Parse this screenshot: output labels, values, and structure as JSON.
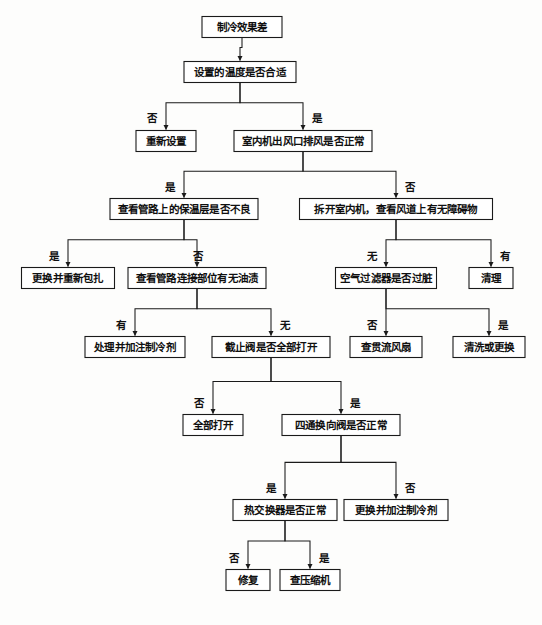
{
  "diagram": {
    "type": "flowchart",
    "orientation": "top-down",
    "colors": {
      "background": "#fdfdfc",
      "node_fill": "#ffffff",
      "node_stroke": "#1a1a1a",
      "text": "#101010",
      "link": "#1a1a1a"
    },
    "nodes": [
      {
        "id": "n1",
        "label": "制冷效果差",
        "x": 242,
        "y": 27,
        "w": 80,
        "h": 21,
        "kind": "start"
      },
      {
        "id": "n2",
        "label": "设置的温度是否合适",
        "x": 240,
        "y": 72,
        "w": 112,
        "h": 21,
        "kind": "decision"
      },
      {
        "id": "n3",
        "label": "重新设置",
        "x": 166,
        "y": 141,
        "w": 60,
        "h": 21,
        "kind": "action"
      },
      {
        "id": "n4",
        "label": "室内机出风口排风是否正常",
        "x": 303,
        "y": 141,
        "w": 138,
        "h": 21,
        "kind": "decision"
      },
      {
        "id": "n5",
        "label": "查看管路上的保温层是否不良",
        "x": 184,
        "y": 209,
        "w": 148,
        "h": 21,
        "kind": "decision"
      },
      {
        "id": "n6",
        "label": "拆开室内机，查看风道上有无障碍物",
        "x": 396,
        "y": 209,
        "w": 193,
        "h": 21,
        "kind": "decision"
      },
      {
        "id": "n7",
        "label": "更换并重新包扎",
        "x": 68,
        "y": 278,
        "w": 93,
        "h": 21,
        "kind": "action"
      },
      {
        "id": "n8",
        "label": "查看管路连接部位有无油渍",
        "x": 197,
        "y": 278,
        "w": 138,
        "h": 21,
        "kind": "decision"
      },
      {
        "id": "n9",
        "label": "空气过滤器是否过脏",
        "x": 386,
        "y": 278,
        "w": 101,
        "h": 21,
        "kind": "decision"
      },
      {
        "id": "n10",
        "label": "清理",
        "x": 491,
        "y": 278,
        "w": 44,
        "h": 21,
        "kind": "action"
      },
      {
        "id": "n11",
        "label": "处理并加注制冷剂",
        "x": 135,
        "y": 347,
        "w": 100,
        "h": 21,
        "kind": "action"
      },
      {
        "id": "n12",
        "label": "截止阀是否全部打开",
        "x": 271,
        "y": 347,
        "w": 118,
        "h": 21,
        "kind": "decision"
      },
      {
        "id": "n13",
        "label": "查贯流风扇",
        "x": 386,
        "y": 347,
        "w": 72,
        "h": 21,
        "kind": "action"
      },
      {
        "id": "n14",
        "label": "清洗或更换",
        "x": 489,
        "y": 347,
        "w": 72,
        "h": 21,
        "kind": "action"
      },
      {
        "id": "n15",
        "label": "全部打开",
        "x": 213,
        "y": 425,
        "w": 60,
        "h": 21,
        "kind": "action"
      },
      {
        "id": "n16",
        "label": "四通换向阀是否正常",
        "x": 341,
        "y": 425,
        "w": 118,
        "h": 21,
        "kind": "decision"
      },
      {
        "id": "n17",
        "label": "热交换器是否正常",
        "x": 285,
        "y": 510,
        "w": 104,
        "h": 21,
        "kind": "decision"
      },
      {
        "id": "n18",
        "label": "更换并加注制冷剂",
        "x": 396,
        "y": 510,
        "w": 104,
        "h": 21,
        "kind": "action"
      },
      {
        "id": "n19",
        "label": "修复",
        "x": 248,
        "y": 580,
        "w": 44,
        "h": 21,
        "kind": "action"
      },
      {
        "id": "n20",
        "label": "查压缩机",
        "x": 310,
        "y": 580,
        "w": 60,
        "h": 21,
        "kind": "action"
      }
    ],
    "edges": [
      {
        "id": "e1",
        "from": "n1",
        "to": "n2",
        "label": "",
        "style": "straight"
      },
      {
        "id": "e2",
        "from": "n2",
        "to": "n3",
        "label": "否",
        "style": "elbow-left",
        "label_x": 152,
        "label_y": 119
      },
      {
        "id": "e3",
        "from": "n2",
        "to": "n4",
        "label": "是",
        "style": "elbow-right",
        "label_x": 317,
        "label_y": 119
      },
      {
        "id": "e4",
        "from": "n4",
        "to": "n5",
        "label": "是",
        "style": "elbow-left",
        "label_x": 170,
        "label_y": 188
      },
      {
        "id": "e5",
        "from": "n4",
        "to": "n6",
        "label": "否",
        "style": "elbow-right",
        "label_x": 410,
        "label_y": 188
      },
      {
        "id": "e6",
        "from": "n5",
        "to": "n7",
        "label": "是",
        "style": "elbow-left",
        "label_x": 54,
        "label_y": 257
      },
      {
        "id": "e7",
        "from": "n5",
        "to": "n8",
        "label": "否",
        "style": "straight",
        "label_x": 198,
        "label_y": 257
      },
      {
        "id": "e8",
        "from": "n6",
        "to": "n9",
        "label": "无",
        "style": "straight",
        "label_x": 372,
        "label_y": 257
      },
      {
        "id": "e9",
        "from": "n6",
        "to": "n10",
        "label": "有",
        "style": "elbow-right",
        "label_x": 505,
        "label_y": 257
      },
      {
        "id": "e10",
        "from": "n8",
        "to": "n11",
        "label": "有",
        "style": "elbow-left",
        "label_x": 121,
        "label_y": 326
      },
      {
        "id": "e11",
        "from": "n8",
        "to": "n12",
        "label": "无",
        "style": "elbow-right",
        "label_x": 285,
        "label_y": 326
      },
      {
        "id": "e12",
        "from": "n9",
        "to": "n13",
        "label": "否",
        "style": "straight",
        "label_x": 372,
        "label_y": 326
      },
      {
        "id": "e13",
        "from": "n9",
        "to": "n14",
        "label": "是",
        "style": "elbow-right",
        "label_x": 503,
        "label_y": 326
      },
      {
        "id": "e14",
        "from": "n12",
        "to": "n15",
        "label": "否",
        "style": "elbow-left",
        "label_x": 199,
        "label_y": 404
      },
      {
        "id": "e15",
        "from": "n12",
        "to": "n16",
        "label": "是",
        "style": "elbow-right",
        "label_x": 355,
        "label_y": 404
      },
      {
        "id": "e16",
        "from": "n16",
        "to": "n17",
        "label": "是",
        "style": "elbow-left",
        "label_x": 271,
        "label_y": 489
      },
      {
        "id": "e17",
        "from": "n16",
        "to": "n18",
        "label": "否",
        "style": "elbow-right",
        "label_x": 410,
        "label_y": 489
      },
      {
        "id": "e18",
        "from": "n17",
        "to": "n19",
        "label": "否",
        "style": "elbow-left",
        "label_x": 234,
        "label_y": 559
      },
      {
        "id": "e19",
        "from": "n17",
        "to": "n20",
        "label": "是",
        "style": "elbow-right",
        "label_x": 324,
        "label_y": 559
      }
    ]
  }
}
